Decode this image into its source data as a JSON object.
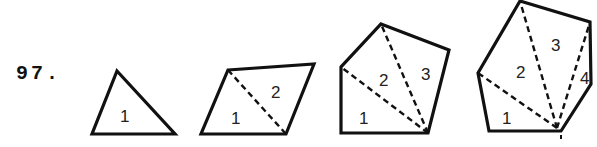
{
  "problem": {
    "number": "97."
  },
  "figures": [
    {
      "name": "triangle",
      "sides": 3,
      "vertices": [
        [
          117,
          71
        ],
        [
          175,
          134
        ],
        [
          92,
          134
        ]
      ],
      "diagonals": [],
      "labels": [
        {
          "text": "1",
          "x": 120,
          "y": 122
        }
      ]
    },
    {
      "name": "quadrilateral",
      "sides": 4,
      "vertices": [
        [
          228,
          70
        ],
        [
          314,
          64
        ],
        [
          286,
          134
        ],
        [
          201,
          134
        ]
      ],
      "diagonals": [
        [
          [
            228,
            70
          ],
          [
            286,
            134
          ]
        ]
      ],
      "labels": [
        {
          "text": "1",
          "x": 231,
          "y": 124
        },
        {
          "text": "2",
          "x": 271,
          "y": 98
        }
      ]
    },
    {
      "name": "pentagon",
      "sides": 5,
      "vertices": [
        [
          381,
          24
        ],
        [
          449,
          50
        ],
        [
          428,
          133
        ],
        [
          341,
          133
        ],
        [
          341,
          67
        ]
      ],
      "diagonals": [
        [
          [
            428,
            133
          ],
          [
            341,
            67
          ]
        ],
        [
          [
            428,
            133
          ],
          [
            381,
            24
          ]
        ]
      ],
      "labels": [
        {
          "text": "1",
          "x": 359,
          "y": 124
        },
        {
          "text": "2",
          "x": 379,
          "y": 86
        },
        {
          "text": "3",
          "x": 421,
          "y": 80
        }
      ]
    },
    {
      "name": "hexagon",
      "sides": 6,
      "vertices": [
        [
          520,
          1
        ],
        [
          590,
          22
        ],
        [
          591,
          84
        ],
        [
          561,
          131
        ],
        [
          489,
          131
        ],
        [
          478,
          73
        ]
      ],
      "diagonals": [
        [
          [
            557,
            128
          ],
          [
            478,
            73
          ]
        ],
        [
          [
            557,
            128
          ],
          [
            520,
            1
          ]
        ],
        [
          [
            557,
            128
          ],
          [
            590,
            22
          ]
        ]
      ],
      "labels": [
        {
          "text": "1",
          "x": 502,
          "y": 124
        },
        {
          "text": "2",
          "x": 516,
          "y": 78
        },
        {
          "text": "3",
          "x": 551,
          "y": 51
        },
        {
          "text": "4",
          "x": 580,
          "y": 84
        }
      ]
    }
  ],
  "colors": {
    "ink": "#111111",
    "background": "#ffffff"
  }
}
